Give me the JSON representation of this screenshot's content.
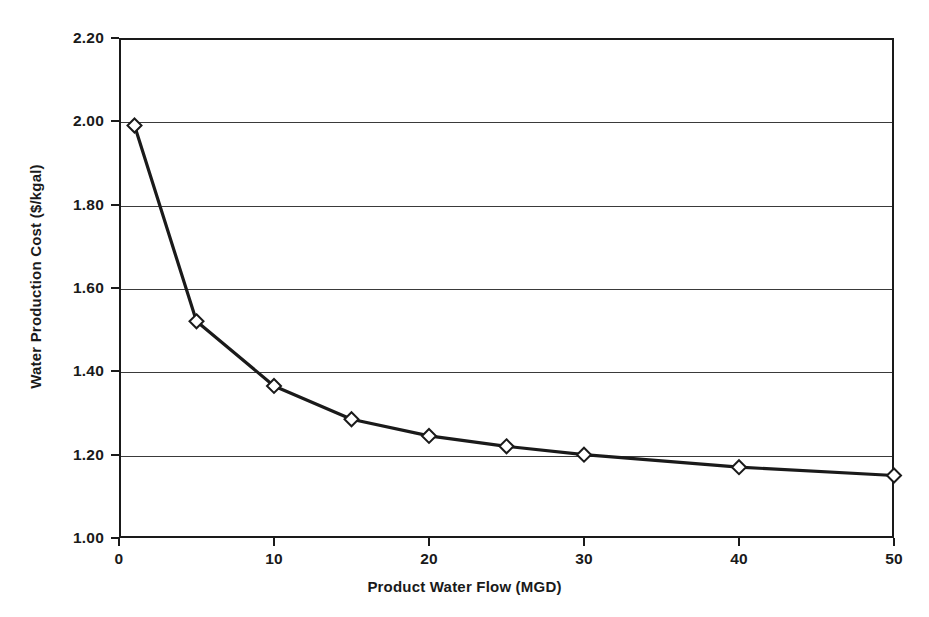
{
  "chart_data": {
    "type": "line",
    "title": "",
    "xlabel": "Product Water Flow (MGD)",
    "ylabel": "Water Production Cost ($/kgal)",
    "xlim": [
      0,
      50
    ],
    "ylim": [
      1.0,
      2.2
    ],
    "grid": "horizontal",
    "legend": "none",
    "marker": "open-diamond",
    "line_color": "#1a1a1a",
    "marker_fill": "#ffffff",
    "x": [
      1,
      5,
      10,
      15,
      20,
      25,
      30,
      40,
      50
    ],
    "values": [
      1.99,
      1.52,
      1.365,
      1.285,
      1.245,
      1.22,
      1.2,
      1.17,
      1.15
    ],
    "series": [
      {
        "name": "Water Production Cost",
        "points": [
          {
            "x": 1,
            "y": 1.99
          },
          {
            "x": 5,
            "y": 1.52
          },
          {
            "x": 10,
            "y": 1.365
          },
          {
            "x": 15,
            "y": 1.285
          },
          {
            "x": 20,
            "y": 1.245
          },
          {
            "x": 25,
            "y": 1.22
          },
          {
            "x": 30,
            "y": 1.2
          },
          {
            "x": 40,
            "y": 1.17
          },
          {
            "x": 50,
            "y": 1.15
          }
        ]
      }
    ],
    "xticks": [
      {
        "value": 0,
        "label": "0"
      },
      {
        "value": 10,
        "label": "10"
      },
      {
        "value": 20,
        "label": "20"
      },
      {
        "value": 30,
        "label": "30"
      },
      {
        "value": 40,
        "label": "40"
      },
      {
        "value": 50,
        "label": "50"
      }
    ],
    "yticks": [
      {
        "value": 1.0,
        "label": "1.00"
      },
      {
        "value": 1.2,
        "label": "1.20"
      },
      {
        "value": 1.4,
        "label": "1.40"
      },
      {
        "value": 1.6,
        "label": "1.60"
      },
      {
        "value": 1.8,
        "label": "1.80"
      },
      {
        "value": 2.0,
        "label": "2.00"
      },
      {
        "value": 2.2,
        "label": "2.20"
      }
    ]
  }
}
